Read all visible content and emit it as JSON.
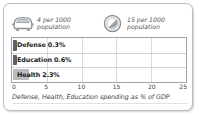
{
  "panel": {
    "background": "#ffffff",
    "border_color": "#b9bcc0"
  },
  "stats": [
    {
      "icon": "car-icon",
      "value_line1": "4 per 1000",
      "value_line2": "population",
      "value": 4,
      "per": 1000,
      "unit": "population"
    },
    {
      "icon": "telephone-dial-icon",
      "value_line1": "15 per 1000",
      "value_line2": "population",
      "value": 15,
      "per": 1000,
      "unit": "population"
    }
  ],
  "chart_data": {
    "type": "bar",
    "orientation": "horizontal",
    "title": "",
    "categories": [
      "Defense",
      "Education",
      "Health"
    ],
    "values": [
      0.3,
      0.6,
      2.3
    ],
    "bar_labels": [
      "Defense 0.3%",
      "Education 0.6%",
      "Health 2.3%"
    ],
    "colors": [
      "#5b5f66",
      "#5b5f66",
      "#b8bcc1"
    ],
    "xlabel": "",
    "ylabel": "",
    "xlim": [
      0,
      25
    ],
    "xticks": [
      0,
      5,
      10,
      15,
      20,
      25
    ],
    "xtick_labels": [
      "0",
      "5",
      "10",
      "15",
      "20",
      "25"
    ],
    "grid": true,
    "legend": false,
    "caption": "Defense, Health, Education spending as % of GDP"
  },
  "caption": "Defense, Health, Education spending as % of GDP"
}
